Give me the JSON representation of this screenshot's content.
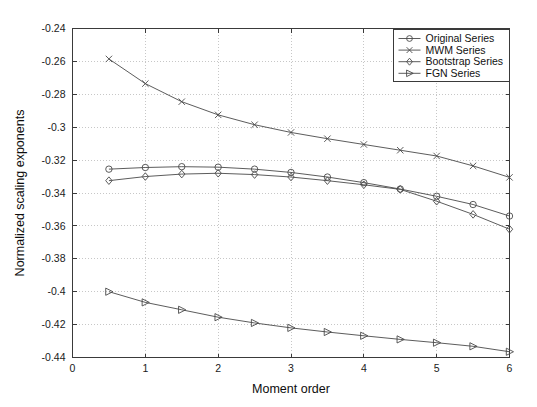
{
  "chart_data": {
    "type": "line",
    "title": "",
    "xlabel": "Moment order",
    "ylabel": "Normalized scaling exponents",
    "xlim": [
      0,
      6
    ],
    "ylim": [
      -0.44,
      -0.24
    ],
    "xticks": [
      0,
      1,
      2,
      3,
      4,
      5,
      6
    ],
    "xticklabels": [
      "0",
      "1",
      "2",
      "3",
      "4",
      "5",
      "6"
    ],
    "yticks": [
      -0.44,
      -0.42,
      -0.4,
      -0.38,
      -0.36,
      -0.34,
      -0.32,
      -0.3,
      -0.28,
      -0.26,
      -0.24
    ],
    "yticklabels": [
      "-0.44",
      "-0.42",
      "-0.4",
      "-0.38",
      "-0.36",
      "-0.34",
      "-0.32",
      "-0.3",
      "-0.28",
      "-0.26",
      "-0.24"
    ],
    "grid": true,
    "legend_position": "upper right",
    "x": [
      0.5,
      1,
      1.5,
      2,
      2.5,
      3,
      3.5,
      4,
      4.5,
      5,
      5.5,
      6
    ],
    "series": [
      {
        "name": "Original Series",
        "marker": "circle",
        "values": [
          -0.3255,
          -0.3245,
          -0.324,
          -0.3243,
          -0.3255,
          -0.3275,
          -0.3303,
          -0.3337,
          -0.3376,
          -0.342,
          -0.347,
          -0.354
        ]
      },
      {
        "name": "MWM Series",
        "marker": "x-cross",
        "values": [
          -0.2585,
          -0.2735,
          -0.2845,
          -0.2925,
          -0.2985,
          -0.3032,
          -0.307,
          -0.3105,
          -0.314,
          -0.3175,
          -0.3235,
          -0.3305
        ]
      },
      {
        "name": "Bootstrap Series",
        "marker": "diamond",
        "values": [
          -0.3325,
          -0.33,
          -0.3285,
          -0.328,
          -0.3288,
          -0.3303,
          -0.3325,
          -0.335,
          -0.3378,
          -0.345,
          -0.353,
          -0.362
        ]
      },
      {
        "name": "FGN Series",
        "marker": "right-triangle",
        "values": [
          -0.4,
          -0.4065,
          -0.411,
          -0.4155,
          -0.419,
          -0.422,
          -0.4245,
          -0.4268,
          -0.429,
          -0.431,
          -0.4332,
          -0.4365
        ]
      }
    ]
  },
  "legend": {
    "entries": [
      {
        "label": "Original Series"
      },
      {
        "label": "MWM Series"
      },
      {
        "label": "Bootstrap Series"
      },
      {
        "label": "FGN Series"
      }
    ]
  },
  "colors": {
    "line": "#4a4a4a",
    "axis": "#3a3a3a",
    "grid": "#b9b9b9",
    "background": "#ffffff"
  }
}
